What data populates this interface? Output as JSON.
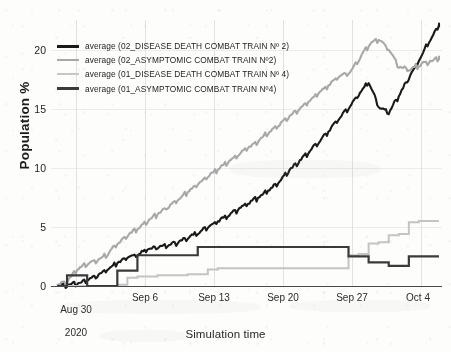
{
  "chart_data": {
    "type": "line",
    "title": "",
    "xlabel": "Simulation time",
    "ylabel": "Population %",
    "xlim": [
      "Aug 28 2020",
      "Oct 6 2020"
    ],
    "ylim": [
      0,
      22.5
    ],
    "yticks": [
      0,
      5,
      10,
      15,
      20
    ],
    "xticks": [
      "Aug 30\n2020",
      "Sep 6",
      "Sep 13",
      "Sep 20",
      "Sep 27",
      "Oct 4"
    ],
    "grid": true,
    "legend_position": "upper-left-inside",
    "series": [
      {
        "name": "average (02_DISEASE DEATH COMBAT TRAIN Nº 2)",
        "color": "#1a1a1a",
        "width": 2.1,
        "x": [
          0,
          1,
          2,
          3,
          4,
          5,
          6,
          7,
          8,
          9,
          10,
          11,
          12,
          13,
          14,
          15,
          16,
          17,
          18,
          19,
          20,
          21,
          22,
          23,
          24,
          25,
          26,
          27,
          28,
          29,
          30,
          31,
          32,
          33,
          34,
          35,
          36,
          37,
          38
        ],
        "values": [
          0,
          0,
          0.1,
          0.4,
          0.8,
          1.3,
          1.9,
          2.3,
          2.6,
          3.0,
          3.2,
          3.4,
          3.6,
          4.0,
          4.4,
          4.9,
          5.4,
          5.9,
          6.4,
          6.9,
          7.4,
          8.0,
          8.6,
          9.6,
          10.4,
          11.2,
          12.1,
          13.0,
          14.0,
          15.0,
          16.1,
          17.2,
          15.1,
          14.6,
          16.0,
          17.5,
          19.0,
          20.6,
          22.0
        ]
      },
      {
        "name": "average (02_ASYMPTOMIC COMBAT TRAIN Nº2)",
        "color": "#a8a8a8",
        "width": 2.1,
        "x": [
          0,
          1,
          2,
          3,
          4,
          5,
          6,
          7,
          8,
          9,
          10,
          11,
          12,
          13,
          14,
          15,
          16,
          17,
          18,
          19,
          20,
          21,
          22,
          23,
          24,
          25,
          26,
          27,
          28,
          29,
          30,
          31,
          32,
          33,
          34,
          35,
          36,
          37,
          38
        ],
        "values": [
          0,
          0.3,
          1.3,
          1.8,
          2.1,
          2.6,
          3.5,
          4.2,
          4.8,
          5.4,
          6.0,
          6.6,
          7.2,
          7.9,
          8.5,
          9.2,
          9.8,
          10.4,
          11.0,
          11.6,
          12.2,
          12.9,
          13.5,
          14.2,
          14.8,
          15.5,
          16.2,
          16.9,
          17.6,
          17.9,
          19.0,
          20.3,
          20.8,
          19.9,
          18.5,
          18.2,
          18.6,
          18.9,
          19.2
        ]
      },
      {
        "name": "average (01_DISEASE DEATH COMBAT TRAIN Nº 4)",
        "color": "#c4c4c4",
        "width": 2.0,
        "x": [
          0,
          1,
          2,
          3,
          4,
          5,
          6,
          7,
          8,
          9,
          10,
          11,
          12,
          13,
          14,
          15,
          16,
          17,
          18,
          19,
          20,
          21,
          22,
          23,
          24,
          25,
          26,
          27,
          28,
          29,
          30,
          31,
          32,
          33,
          34,
          35,
          36,
          37,
          38
        ],
        "values": [
          0,
          0,
          0,
          0,
          0,
          0,
          0.1,
          0.7,
          0.8,
          0.8,
          0.9,
          0.9,
          0.9,
          1.0,
          1.0,
          1.4,
          1.5,
          1.5,
          1.5,
          1.5,
          1.5,
          1.5,
          1.5,
          1.5,
          1.5,
          1.5,
          1.5,
          1.5,
          1.5,
          2.6,
          2.7,
          3.6,
          3.7,
          4.3,
          4.4,
          5.4,
          5.5,
          5.5,
          5.5
        ]
      },
      {
        "name": "average (01_ASYMPTOMIC COMBAT TRAIN Nº4)",
        "color": "#3a3a3a",
        "width": 2.2,
        "x": [
          0,
          1,
          2,
          3,
          4,
          5,
          6,
          7,
          8,
          9,
          10,
          11,
          12,
          13,
          14,
          15,
          16,
          17,
          18,
          19,
          20,
          21,
          22,
          23,
          24,
          25,
          26,
          27,
          28,
          29,
          30,
          31,
          32,
          33,
          34,
          35,
          36,
          37,
          38
        ],
        "values": [
          0,
          0.9,
          0.9,
          0,
          0,
          0,
          1.3,
          1.3,
          2.6,
          2.6,
          2.6,
          2.6,
          2.6,
          2.6,
          3.3,
          3.3,
          3.3,
          3.3,
          3.3,
          3.3,
          3.3,
          3.3,
          3.3,
          3.3,
          3.3,
          3.3,
          3.3,
          3.3,
          3.3,
          2.5,
          2.5,
          2.0,
          2.0,
          1.7,
          1.7,
          2.5,
          2.5,
          2.5,
          2.5
        ]
      }
    ]
  },
  "axes": {
    "ylabel": "Population %",
    "xlabel": "Simulation time",
    "yticks": [
      "20",
      "15",
      "10",
      "5",
      "0"
    ],
    "xticks": [
      {
        "line1": "Aug 30",
        "line2": "2020"
      },
      {
        "line1": "Sep 6",
        "line2": ""
      },
      {
        "line1": "Sep 13",
        "line2": ""
      },
      {
        "line1": "Sep 20",
        "line2": ""
      },
      {
        "line1": "Sep 27",
        "line2": ""
      },
      {
        "line1": "Oct 4",
        "line2": ""
      }
    ]
  },
  "legend": {
    "items": [
      {
        "label": "average (02_DISEASE DEATH COMBAT TRAIN Nº 2)",
        "color": "#1a1a1a"
      },
      {
        "label": "average (02_ASYMPTOMIC COMBAT TRAIN Nº2)",
        "color": "#a8a8a8"
      },
      {
        "label": "average (01_DISEASE DEATH COMBAT TRAIN Nº 4)",
        "color": "#c6c6c6"
      },
      {
        "label": "average (01_ASYMPTOMIC COMBAT TRAIN Nº4)",
        "color": "#3a3a3a"
      }
    ]
  }
}
